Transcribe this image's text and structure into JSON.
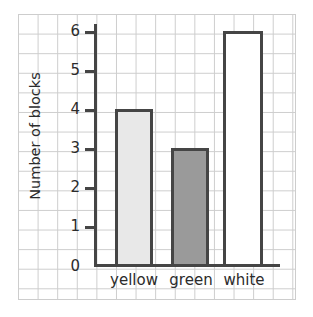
{
  "chart_data": {
    "type": "bar",
    "title": "",
    "xlabel": "",
    "ylabel": "Number of blocks",
    "categories": [
      "yellow",
      "green",
      "white"
    ],
    "values": [
      4,
      3,
      6
    ],
    "series": [
      {
        "name": "Number of blocks",
        "values": [
          4,
          3,
          6
        ]
      }
    ],
    "ylim": [
      0,
      6
    ],
    "ytick_labels": [
      "0",
      "1",
      "2",
      "3",
      "4",
      "5",
      "6"
    ],
    "ytick_values": [
      0,
      1,
      2,
      3,
      4,
      5,
      6
    ],
    "grid": true,
    "legend": false,
    "bar_styles": [
      {
        "category": "yellow",
        "fill": "#e8e8e8",
        "stroke": "#454545"
      },
      {
        "category": "green",
        "fill": "#9a9a9a",
        "stroke": "#454545"
      },
      {
        "category": "white",
        "fill": "#ffffff",
        "stroke": "#454545"
      }
    ],
    "colors": {
      "grid_line": "#cdcdcd",
      "axis": "#454545",
      "text": "#2b2b2b",
      "background": "#ffffff"
    }
  },
  "axis": {
    "y_title": "Number of blocks",
    "ticks": [
      {
        "label": "6",
        "value": 6
      },
      {
        "label": "5",
        "value": 5
      },
      {
        "label": "4",
        "value": 4
      },
      {
        "label": "3",
        "value": 3
      },
      {
        "label": "2",
        "value": 2
      },
      {
        "label": "1",
        "value": 1
      },
      {
        "label": "0",
        "value": 0
      }
    ]
  },
  "bars": [
    {
      "label": "yellow",
      "value": 4
    },
    {
      "label": "green",
      "value": 3
    },
    {
      "label": "white",
      "value": 6
    }
  ]
}
